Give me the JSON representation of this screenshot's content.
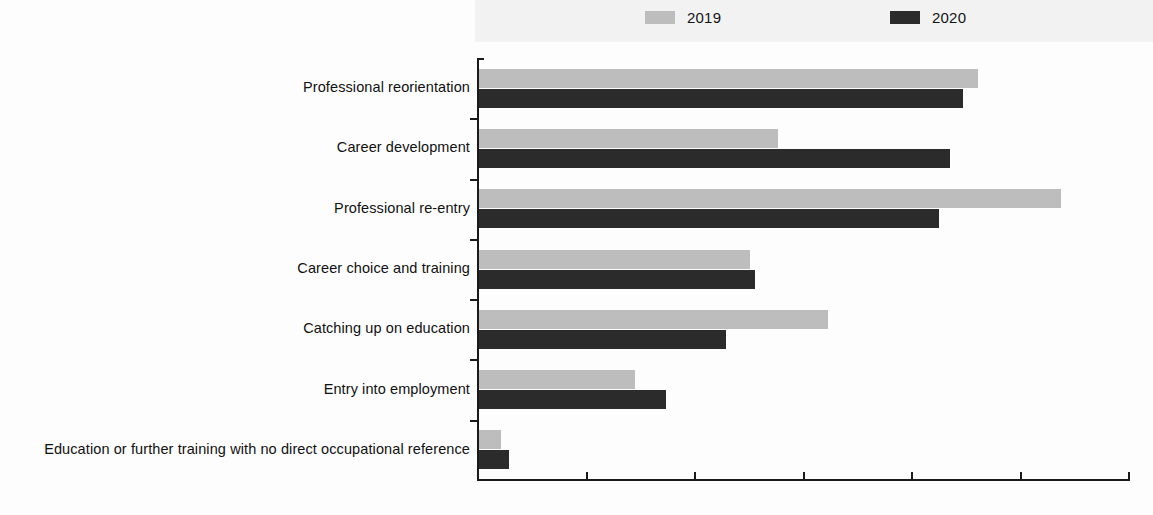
{
  "legend": {
    "entries": [
      {
        "label": "2019",
        "color": "#bdbdbd"
      },
      {
        "label": "2020",
        "color": "#2b2b2b"
      }
    ]
  },
  "axis": {
    "tick_labels": [
      "0",
      "5",
      "10",
      "15",
      "20",
      "25",
      "30"
    ]
  },
  "chart_data": {
    "type": "bar",
    "orientation": "horizontal",
    "title": "",
    "subtitle": "",
    "xlabel": "",
    "ylabel": "",
    "xlim": [
      0,
      30
    ],
    "xticks": [
      0,
      5,
      10,
      15,
      20,
      25,
      30
    ],
    "grid": false,
    "legend_position": "top",
    "categories": [
      "Professional reorientation",
      "Career development",
      "Professional re-entry",
      "Career choice and training",
      "Catching up on education",
      "Entry into employment",
      "Education or further training with no direct occupational reference"
    ],
    "series": [
      {
        "name": "2019",
        "color": "#bdbdbd",
        "values": [
          23.0,
          13.8,
          26.8,
          12.5,
          16.1,
          7.2,
          1.0
        ]
      },
      {
        "name": "2020",
        "color": "#2b2b2b",
        "values": [
          22.3,
          21.7,
          21.2,
          12.7,
          11.4,
          8.6,
          1.4
        ]
      }
    ]
  }
}
